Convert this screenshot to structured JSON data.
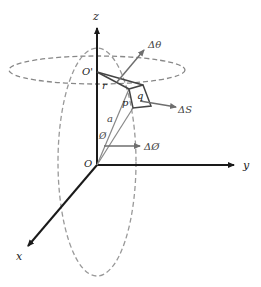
{
  "diagram": {
    "axes": {
      "z_label": "z",
      "y_label": "y",
      "x_label": "x",
      "origin_label": "O"
    },
    "points": {
      "o_prime_label": "O'",
      "r_label": "r",
      "p_label": "p",
      "q_label": "q",
      "a_label": "a",
      "phi_angle_label": "Ø"
    },
    "vectors": {
      "delta_theta_label": "Δθ",
      "delta_s_label": "ΔS",
      "delta_phi_label": "ΔØ"
    },
    "colors": {
      "axis": "#1a1a1a",
      "dashed": "#888888",
      "vector": "#6e6e6e",
      "solid_shape": "#555555"
    }
  }
}
